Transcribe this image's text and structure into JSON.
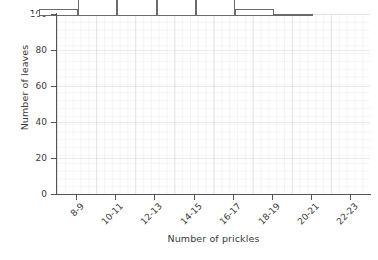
{
  "chart_data": {
    "type": "bar",
    "title": "",
    "xlabel": "Number of prickles",
    "ylabel": "Number of leaves",
    "categories": [
      "8-9",
      "10-11",
      "12-13",
      "14-15",
      "16-17",
      "18-19",
      "20-21",
      "22-23"
    ],
    "values": [
      1,
      4,
      58,
      89,
      50,
      20,
      4,
      1
    ],
    "ylim": [
      0,
      100
    ],
    "yticks": [
      0,
      20,
      40,
      60,
      80,
      100
    ],
    "ytick_labels": [
      "0",
      "20",
      "40",
      "60",
      "80",
      "100"
    ],
    "grid": true,
    "legend": null,
    "bar_style": {
      "face_color": "#ffffff",
      "edge_color": "#6a6a6a"
    },
    "axis_color": "#555555",
    "text_color": "#3a3a3a",
    "grid_color": "#b9b9c8"
  }
}
